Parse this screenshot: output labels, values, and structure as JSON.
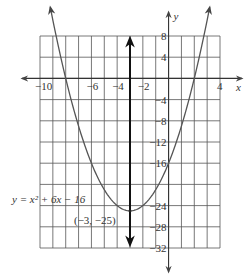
{
  "figure": {
    "equation_label": "y = x² + 6x − 16",
    "vertex_label": "(−3, −25)",
    "x_axis_label": "x",
    "y_axis_label": "y",
    "x_tick_labels": [
      {
        "value": -10,
        "text": "−10"
      },
      {
        "value": -6,
        "text": "−6"
      },
      {
        "value": -4,
        "text": "−4"
      },
      {
        "value": -2,
        "text": "−2"
      },
      {
        "value": 4,
        "text": "4"
      }
    ],
    "y_tick_labels": [
      {
        "value": 8,
        "text": "8"
      },
      {
        "value": 4,
        "text": "4"
      },
      {
        "value": -4,
        "text": "−4"
      },
      {
        "value": -8,
        "text": "−8"
      },
      {
        "value": -12,
        "text": "−12"
      },
      {
        "value": -16,
        "text": "−16"
      },
      {
        "value": -24,
        "text": "−24"
      },
      {
        "value": -28,
        "text": "−28"
      },
      {
        "value": -32,
        "text": "−32"
      }
    ],
    "colors": {
      "grid": "#555555",
      "curve": "#555555",
      "axis": "#333333",
      "symmetry_line": "#111111"
    }
  },
  "chart_data": {
    "type": "line",
    "title": "",
    "function": "y = x^2 + 6x - 16",
    "vertex": {
      "x": -3,
      "y": -25
    },
    "axis_of_symmetry": "x = -3",
    "xlabel": "x",
    "ylabel": "y",
    "xlim": [
      -10,
      4
    ],
    "ylim": [
      -32,
      8
    ],
    "x_grid_step": 1,
    "y_grid_step": 4,
    "grid": true,
    "series": [
      {
        "name": "y = x^2 + 6x - 16",
        "x": [
          -9.24,
          -9,
          -8,
          -7,
          -6,
          -5,
          -4,
          -3,
          -2,
          -1,
          0,
          1,
          2,
          3,
          3.24
        ],
        "values": [
          8,
          11,
          0,
          -9,
          -16,
          -21,
          -24,
          -25,
          -24,
          -21,
          -16,
          -9,
          0,
          11,
          8
        ]
      }
    ]
  }
}
